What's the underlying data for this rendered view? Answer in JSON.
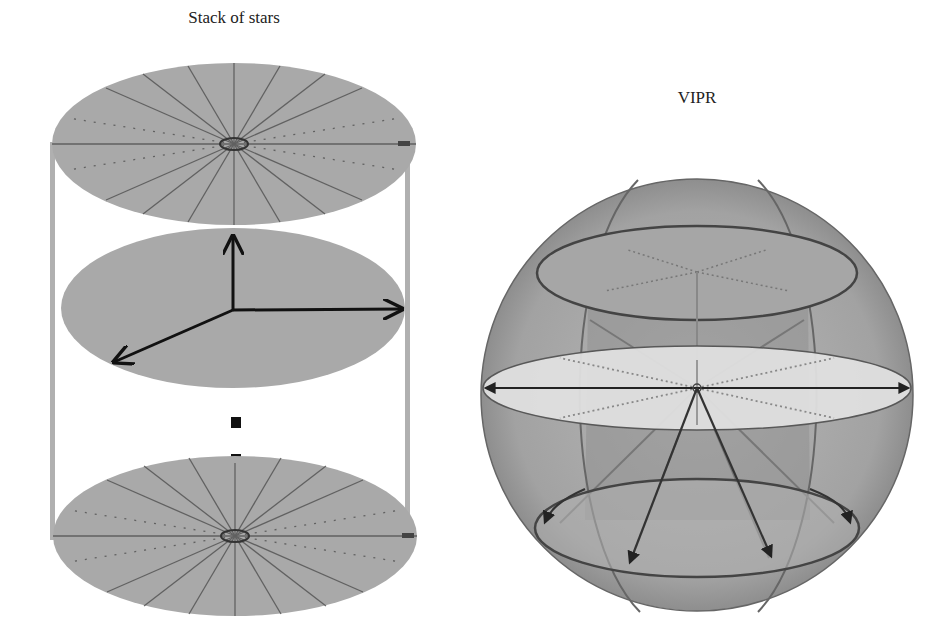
{
  "figure": {
    "left_panel": {
      "title": "Stack of stars",
      "elements": [
        "top-radial-disk",
        "middle-disk-with-3d-axes",
        "ellipsis-dots",
        "bottom-radial-disk",
        "cylinder-side-bars"
      ],
      "spokes_per_disk": 16
    },
    "right_panel": {
      "title": "VIPR",
      "elements": [
        "sphere",
        "upper-latitude-ellipse",
        "equatorial-plane",
        "lower-latitude-ellipse",
        "meridian-arcs",
        "radial-arrows"
      ]
    },
    "colors": {
      "disk_fill": "#a8a8a8",
      "line": "#333333",
      "sphere_fill": "#9e9e9e",
      "equator_fill": "#e2e2e2"
    }
  }
}
